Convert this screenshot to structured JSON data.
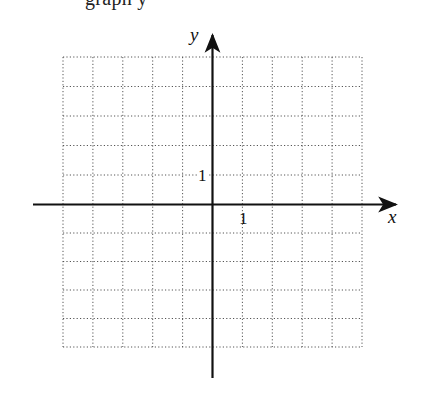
{
  "caption_fragment": "graph y",
  "axes": {
    "x_label": "x",
    "y_label": "y",
    "x_tick_label": "1",
    "y_tick_label": "1",
    "axis_color": "#111111",
    "grid_color": "#555555"
  },
  "grid": {
    "columns": 10,
    "rows": 10,
    "x_range": [
      -5,
      5
    ],
    "y_range": [
      -5,
      5
    ],
    "style": "dotted"
  },
  "chart_data": {
    "type": "scatter",
    "title": "",
    "xlabel": "x",
    "ylabel": "y",
    "xlim": [
      -5,
      5
    ],
    "ylim": [
      -5,
      5
    ],
    "grid": true,
    "tick_labels": {
      "x": [
        "1"
      ],
      "y": [
        "1"
      ]
    },
    "series": []
  }
}
